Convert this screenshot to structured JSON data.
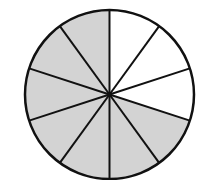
{
  "diagram": {
    "type": "fraction-circle",
    "total_parts": 10,
    "shaded_parts": 7,
    "unshaded_parts": 3,
    "start_angle_deg": -90,
    "direction": "clockwise",
    "sectors": [
      {
        "index": 0,
        "shaded": false
      },
      {
        "index": 1,
        "shaded": false
      },
      {
        "index": 2,
        "shaded": false
      },
      {
        "index": 3,
        "shaded": true
      },
      {
        "index": 4,
        "shaded": true
      },
      {
        "index": 5,
        "shaded": true
      },
      {
        "index": 6,
        "shaded": true
      },
      {
        "index": 7,
        "shaded": true
      },
      {
        "index": 8,
        "shaded": true
      },
      {
        "index": 9,
        "shaded": true
      }
    ],
    "geometry": {
      "cx": 109.5,
      "cy": 94.5,
      "r": 84.5
    },
    "colors": {
      "shaded": "#d3d3d3",
      "unshaded": "#ffffff",
      "stroke": "#111111"
    },
    "stroke_width": 2
  }
}
